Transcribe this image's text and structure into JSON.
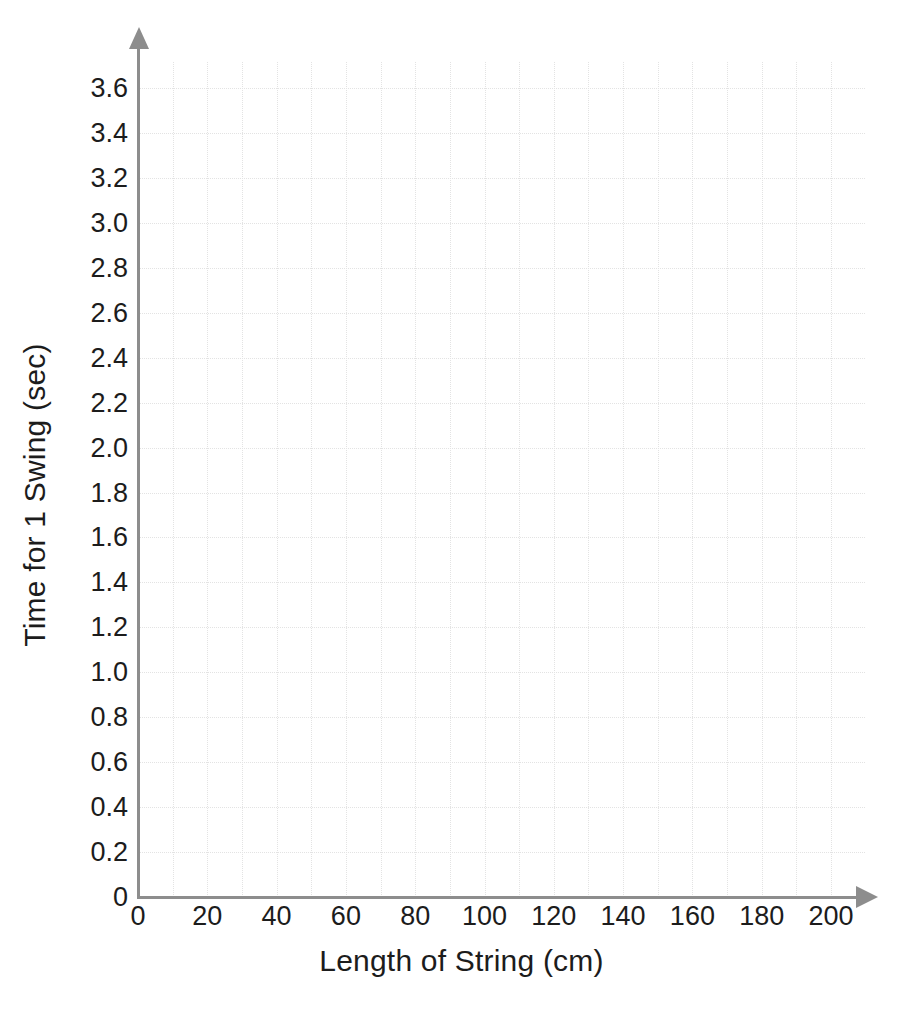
{
  "chart_data": {
    "type": "scatter",
    "title": "",
    "subtitle": "",
    "xlabel": "Length of String (cm)",
    "ylabel": "Time for 1 Swing (sec)",
    "xlim": [
      0,
      200
    ],
    "ylim": [
      0,
      3.6
    ],
    "x_major_step": 20,
    "x_minor_step": 10,
    "y_major_step": 0.2,
    "grid": true,
    "grid_style": "dotted",
    "grid_color": "#e3e3e3",
    "legend": null,
    "series": [],
    "values": [],
    "x": [],
    "annotations": [],
    "note": "Empty grid / blank graph paper template with labelled axes; no data points plotted.",
    "x_tick_labels": [
      "0",
      "20",
      "40",
      "60",
      "80",
      "100",
      "120",
      "140",
      "160",
      "180",
      "200"
    ],
    "x_tick_values": [
      0,
      20,
      40,
      60,
      80,
      100,
      120,
      140,
      160,
      180,
      200
    ],
    "y_tick_labels": [
      "0",
      "0.2",
      "0.4",
      "0.6",
      "0.8",
      "1.0",
      "1.2",
      "1.4",
      "1.6",
      "1.8",
      "2.0",
      "2.2",
      "2.4",
      "2.6",
      "2.8",
      "3.0",
      "3.2",
      "3.4",
      "3.6"
    ],
    "y_tick_values": [
      0,
      0.2,
      0.4,
      0.6,
      0.8,
      1.0,
      1.2,
      1.4,
      1.6,
      1.8,
      2.0,
      2.2,
      2.4,
      2.6,
      2.8,
      3.0,
      3.2,
      3.4,
      3.6
    ]
  },
  "style": {
    "axis_color": "#8d8d8d",
    "text_color": "#1c1c1c",
    "background": "#ffffff",
    "grid_color": "#e3e3e3",
    "x_axis_arrow": "arrow-right-icon",
    "y_axis_arrow": "arrow-up-icon"
  }
}
